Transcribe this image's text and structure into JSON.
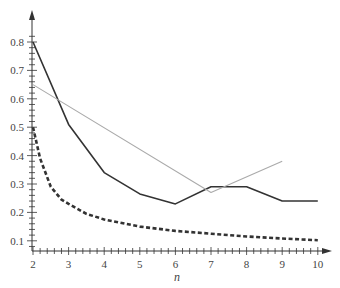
{
  "chart_data": {
    "type": "line",
    "title": "",
    "xlabel": "n",
    "ylabel": "",
    "xlim": [
      2,
      10
    ],
    "ylim": [
      0.065,
      0.84
    ],
    "grid": false,
    "legend": null,
    "x_ticks": [
      2,
      3,
      4,
      5,
      6,
      7,
      8,
      9,
      10
    ],
    "x_tick_labels": [
      "2",
      "3",
      "4",
      "5",
      "6",
      "7",
      "8",
      "9",
      "10"
    ],
    "y_ticks": [
      0.1,
      0.2,
      0.3,
      0.4,
      0.5,
      0.6,
      0.7,
      0.8
    ],
    "y_tick_labels": [
      "0.1",
      "0.2",
      "0.3",
      "0.4",
      "0.5",
      "0.6",
      "0.7",
      "0.8"
    ],
    "series": [
      {
        "name": "solid-dark",
        "style": "solid",
        "color": "#333333",
        "width": 1.6,
        "x": [
          2,
          3,
          4,
          5,
          6,
          7,
          8,
          9,
          10
        ],
        "values": [
          0.8,
          0.51,
          0.34,
          0.265,
          0.23,
          0.29,
          0.29,
          0.24,
          0.24
        ]
      },
      {
        "name": "solid-gray",
        "style": "solid",
        "color": "#aaaaaa",
        "width": 1.1,
        "x": [
          2,
          7,
          9
        ],
        "values": [
          0.65,
          0.27,
          0.38
        ]
      },
      {
        "name": "dashed-dark",
        "style": "dashed",
        "color": "#333333",
        "width": 2.6,
        "x": [
          2,
          2.2,
          2.5,
          2.8,
          3,
          3.5,
          4,
          5,
          6,
          7,
          8,
          9,
          10
        ],
        "values": [
          0.5,
          0.39,
          0.29,
          0.245,
          0.23,
          0.195,
          0.175,
          0.15,
          0.135,
          0.125,
          0.115,
          0.108,
          0.102
        ]
      }
    ]
  },
  "axes": {
    "x_label": "n"
  }
}
